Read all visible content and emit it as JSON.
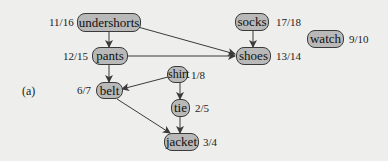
{
  "diagram": {
    "caption": "(a)",
    "colors": {
      "background": "#eeeeec",
      "node_fill": "#b9b9b9",
      "node_border": "#3a3a3a",
      "edge": "#3a3a3a"
    },
    "nodes": {
      "undershorts": {
        "label": "undershorts",
        "times": "11/16"
      },
      "pants": {
        "label": "pants",
        "times": "12/15"
      },
      "belt": {
        "label": "belt",
        "times": "6/7"
      },
      "shirt": {
        "label": "shirt",
        "times": "1/8"
      },
      "tie": {
        "label": "tie",
        "times": "2/5"
      },
      "jacket": {
        "label": "jacket",
        "times": "3/4"
      },
      "socks": {
        "label": "socks",
        "times": "17/18"
      },
      "shoes": {
        "label": "shoes",
        "times": "13/14"
      },
      "watch": {
        "label": "watch",
        "times": "9/10"
      }
    },
    "edges": [
      {
        "from": "undershorts",
        "to": "pants"
      },
      {
        "from": "undershorts",
        "to": "shoes"
      },
      {
        "from": "pants",
        "to": "shoes"
      },
      {
        "from": "pants",
        "to": "belt"
      },
      {
        "from": "socks",
        "to": "shoes"
      },
      {
        "from": "shirt",
        "to": "belt"
      },
      {
        "from": "shirt",
        "to": "tie"
      },
      {
        "from": "belt",
        "to": "jacket"
      },
      {
        "from": "tie",
        "to": "jacket"
      }
    ]
  }
}
